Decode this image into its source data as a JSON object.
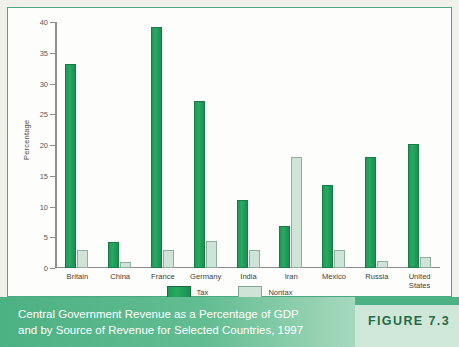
{
  "figure": {
    "badge_label": "FIGURE 7.3",
    "caption_line1": "Central Government Revenue as a Percentage of GDP",
    "caption_line2": "and by Source of Revenue for Selected Countries, 1997"
  },
  "colors": {
    "tax": "#1d9a57",
    "nontax": "#cfe4d7",
    "frame": "#4aa882",
    "band": "#4cb183",
    "badge_text": "#1f6b47"
  },
  "chart_data": {
    "type": "bar",
    "title": "Central Government Revenue as a Percentage of GDP and by Source of Revenue for Selected Countries, 1997",
    "xlabel": "",
    "ylabel": "Percentage",
    "ylim": [
      0,
      40
    ],
    "yticks": [
      0,
      5,
      10,
      15,
      20,
      25,
      30,
      35,
      40
    ],
    "grid": false,
    "legend_position": "bottom",
    "categories": [
      "Britain",
      "China",
      "France",
      "Germany",
      "India",
      "Iran",
      "Mexico",
      "Russia",
      "United States"
    ],
    "series": [
      {
        "name": "Tax",
        "values": [
          33.2,
          4.3,
          39.2,
          27.1,
          11.1,
          6.8,
          13.5,
          18.0,
          20.2
        ]
      },
      {
        "name": "Nontax",
        "values": [
          2.9,
          1.0,
          3.0,
          4.4,
          2.9,
          18.0,
          2.9,
          1.2,
          1.8
        ]
      }
    ]
  }
}
